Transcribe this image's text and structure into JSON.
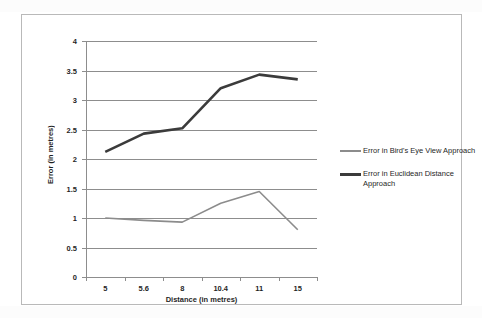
{
  "chart_data": {
    "type": "line",
    "title": "",
    "xlabel": "Distance  (in metres)",
    "ylabel": "Error (in metres)",
    "categories": [
      "5",
      "5.6",
      "8",
      "10.4",
      "11",
      "15"
    ],
    "ylim": [
      0,
      4
    ],
    "ytick_labels": [
      "0",
      "0.5",
      "1",
      "1.5",
      "2",
      "2.5",
      "3",
      "3.5",
      "4"
    ],
    "ytick_values": [
      0,
      0.5,
      1,
      1.5,
      2,
      2.5,
      3,
      3.5,
      4
    ],
    "grid": true,
    "legend_position": "right",
    "series": [
      {
        "name": "Error in Bird's Eye View Approach",
        "color": "#8c8c8c",
        "width": 1.6,
        "values": [
          1.0,
          0.96,
          0.93,
          1.25,
          1.45,
          0.8
        ]
      },
      {
        "name": "Error in Euclidean Distance Approach",
        "color": "#3b3b3b",
        "width": 2.6,
        "values": [
          2.12,
          2.43,
          2.52,
          3.2,
          3.43,
          3.35
        ]
      }
    ]
  },
  "legend": {
    "entries": [
      {
        "label": "Error in Bird's Eye View Approach"
      },
      {
        "label": "Error in Euclidean Distance Approach"
      }
    ]
  },
  "axes": {
    "x_title": "Distance  (in metres)",
    "y_title": "Error (in metres)"
  }
}
